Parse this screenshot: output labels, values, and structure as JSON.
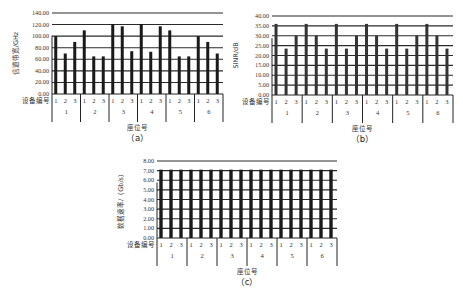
{
  "chart_data": [
    {
      "id": "a",
      "type": "bar",
      "title": "",
      "caption": "（a）",
      "ylabel": "信道带宽/GHz",
      "xlabel": "座位号",
      "x_row_label": "设备编号",
      "groups": [
        "1",
        "2",
        "3",
        "4",
        "5",
        "6"
      ],
      "devices": [
        "1",
        "2",
        "3"
      ],
      "yticks": [
        "0.00",
        "20.00",
        "40.00",
        "60.00",
        "80.00",
        "100.00",
        "120.00",
        "140.00"
      ],
      "ylim": [
        0,
        140
      ],
      "grid": true,
      "values": [
        [
          100,
          70,
          90
        ],
        [
          110,
          65,
          65
        ],
        [
          121,
          117,
          74
        ],
        [
          121,
          73,
          117
        ],
        [
          110,
          65,
          65
        ],
        [
          100,
          90,
          70
        ]
      ]
    },
    {
      "id": "b",
      "type": "bar",
      "title": "",
      "caption": "（b）",
      "ylabel": "SINR/dB",
      "xlabel": "座位号",
      "x_row_label": "设备编号",
      "groups": [
        "1",
        "2",
        "3",
        "4",
        "5",
        "6"
      ],
      "devices": [
        "1",
        "2",
        "3"
      ],
      "yticks": [
        "0.00",
        "5.00",
        "10.00",
        "15.00",
        "20.00",
        "25.00",
        "30.00",
        "35.00",
        "40.00"
      ],
      "ylim": [
        0,
        40
      ],
      "grid": true,
      "values": [
        [
          36,
          23.5,
          30
        ],
        [
          36,
          30,
          23.5
        ],
        [
          36,
          23.5,
          30
        ],
        [
          36,
          30,
          23.5
        ],
        [
          36,
          23.5,
          30
        ],
        [
          36,
          30,
          23.5
        ]
      ]
    },
    {
      "id": "c",
      "type": "bar",
      "title": "",
      "caption": "（c）",
      "ylabel": "数据速率/（Gb/s）",
      "xlabel": "座位号",
      "x_row_label": "设备编号",
      "groups": [
        "1",
        "2",
        "3",
        "4",
        "5",
        "6"
      ],
      "devices": [
        "1",
        "2",
        "3"
      ],
      "yticks": [
        "0.00",
        "1.00",
        "2.00",
        "3.00",
        "4.00",
        "5.00",
        "6.00",
        "7.00",
        "8.00"
      ],
      "ylim": [
        0,
        8
      ],
      "grid": true,
      "values": [
        [
          7.1,
          7.1,
          7.1
        ],
        [
          7.1,
          7.1,
          7.1
        ],
        [
          7.1,
          7.1,
          7.1
        ],
        [
          7.1,
          7.1,
          7.1
        ],
        [
          7.1,
          7.1,
          7.1
        ],
        [
          7.1,
          7.1,
          7.1
        ]
      ]
    }
  ],
  "layout": {
    "panels": [
      {
        "left": 52,
        "top": 13,
        "right": 223,
        "bottom": 94,
        "barColor": "#1a1a1a",
        "barWidth": 3
      },
      {
        "left": 272,
        "top": 16,
        "right": 453,
        "bottom": 95,
        "barColor": "#333333",
        "barWidth": 3
      },
      {
        "left": 157,
        "top": 161,
        "right": 337,
        "bottom": 238,
        "barColor": "#1a1a1a",
        "barWidth": 3.4
      }
    ]
  }
}
